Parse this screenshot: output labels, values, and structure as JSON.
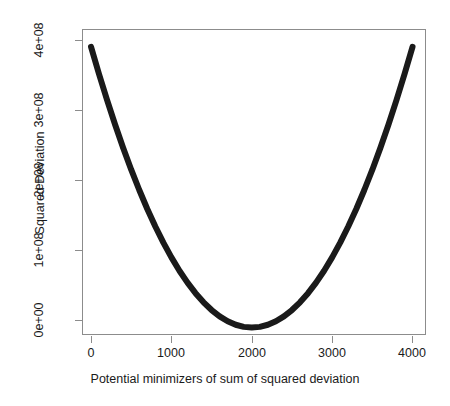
{
  "chart_data": {
    "type": "line",
    "title": "",
    "xlabel": "Potential minimizers of sum of squared deviation",
    "ylabel": "Squared Deviation",
    "xlim": [
      -100,
      4180
    ],
    "ylim": [
      -12000000,
      424000000
    ],
    "xticks": [
      0,
      1000,
      2000,
      3000,
      4000
    ],
    "xticklabels": [
      "0",
      "1000",
      "2000",
      "3000",
      "4000"
    ],
    "yticks": [
      0,
      100000000,
      200000000,
      300000000,
      400000000
    ],
    "yticklabels": [
      "0e+00",
      "1e+08",
      "2e+08",
      "3e+08",
      "4e+08"
    ],
    "grid": false,
    "legend": null,
    "line_color": "#1a1a1a",
    "line_width": 6,
    "axis_color": "#8c8c8c",
    "background": "#ffffff",
    "series": [
      {
        "name": "sum of squared deviation",
        "comment": "parabola minimized at x=2000 with value 0; y = 100*(x-2000)^2",
        "x": [
          0,
          100,
          200,
          300,
          400,
          500,
          600,
          700,
          800,
          900,
          1000,
          1100,
          1200,
          1300,
          1400,
          1500,
          1600,
          1700,
          1800,
          1900,
          2000,
          2100,
          2200,
          2300,
          2400,
          2500,
          2600,
          2700,
          2800,
          2900,
          3000,
          3100,
          3200,
          3300,
          3400,
          3500,
          3600,
          3700,
          3800,
          3900,
          4000
        ],
        "y": [
          400000000,
          361000000,
          324000000,
          289000000,
          256000000,
          225000000,
          196000000,
          169000000,
          144000000,
          121000000,
          100000000,
          81000000,
          64000000,
          49000000,
          36000000,
          25000000,
          16000000,
          9000000,
          4000000,
          1000000,
          0,
          1000000,
          4000000,
          9000000,
          16000000,
          25000000,
          36000000,
          49000000,
          64000000,
          81000000,
          100000000,
          121000000,
          144000000,
          169000000,
          196000000,
          225000000,
          256000000,
          289000000,
          324000000,
          361000000,
          400000000
        ]
      }
    ]
  },
  "axes": {
    "x_title": "Potential minimizers of sum of squared deviation",
    "y_title": "Squared Deviation",
    "x_tick_labels": [
      "0",
      "1000",
      "2000",
      "3000",
      "4000"
    ],
    "y_tick_labels": [
      "0e+00",
      "1e+08",
      "2e+08",
      "3e+08",
      "4e+08"
    ]
  }
}
